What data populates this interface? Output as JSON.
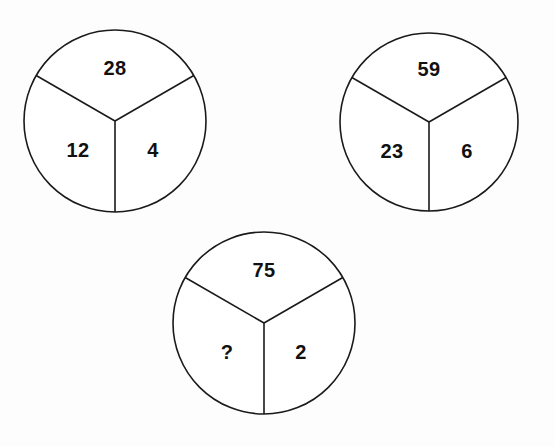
{
  "figure": {
    "background_color": "#fdfdfd",
    "stroke_color": "#1a1a1a",
    "text_color": "#111111"
  },
  "chart_data": {
    "type": "diagram",
    "title": "",
    "subtitle": "",
    "xlabel": "",
    "ylabel": "",
    "grid": false,
    "legend": false,
    "shape": "circle-divided-in-thirds",
    "sector_order": [
      "top",
      "lower-left",
      "lower-right"
    ],
    "circles": [
      {
        "id": "circle-1",
        "cx": 115,
        "cy": 121,
        "r": 91,
        "sectors": [
          {
            "position": "top",
            "value": "28",
            "lx": 115,
            "ly": 69
          },
          {
            "position": "lower-left",
            "value": "12",
            "lx": 78,
            "ly": 152
          },
          {
            "position": "lower-right",
            "value": "4",
            "lx": 153,
            "ly": 152
          }
        ]
      },
      {
        "id": "circle-2",
        "cx": 429,
        "cy": 122,
        "r": 89,
        "sectors": [
          {
            "position": "top",
            "value": "59",
            "lx": 429,
            "ly": 70
          },
          {
            "position": "lower-left",
            "value": "23",
            "lx": 392,
            "ly": 153
          },
          {
            "position": "lower-right",
            "value": "6",
            "lx": 467,
            "ly": 153
          }
        ]
      },
      {
        "id": "circle-3",
        "cx": 264,
        "cy": 323,
        "r": 91,
        "sectors": [
          {
            "position": "top",
            "value": "75",
            "lx": 264,
            "ly": 271
          },
          {
            "position": "lower-left",
            "value": "?",
            "lx": 227,
            "ly": 354
          },
          {
            "position": "lower-right",
            "value": "2",
            "lx": 301,
            "ly": 354
          }
        ]
      }
    ],
    "values": [
      28,
      12,
      4,
      59,
      23,
      6,
      75,
      null,
      2
    ],
    "unknown_marker": "?"
  }
}
